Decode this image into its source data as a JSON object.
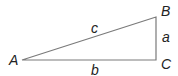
{
  "diagram": {
    "type": "right-triangle",
    "line_color": "#7a7a7a",
    "label_color": "#222222",
    "vertices": [
      {
        "id": "A",
        "label": "A",
        "x": 22,
        "y": 60
      },
      {
        "id": "B",
        "label": "B",
        "x": 156,
        "y": 17
      },
      {
        "id": "C",
        "label": "C",
        "x": 156,
        "y": 60
      }
    ],
    "sides": [
      {
        "id": "c",
        "label": "c",
        "from": "A",
        "to": "B"
      },
      {
        "id": "a",
        "label": "a",
        "from": "B",
        "to": "C"
      },
      {
        "id": "b",
        "label": "b",
        "from": "A",
        "to": "C"
      }
    ]
  }
}
